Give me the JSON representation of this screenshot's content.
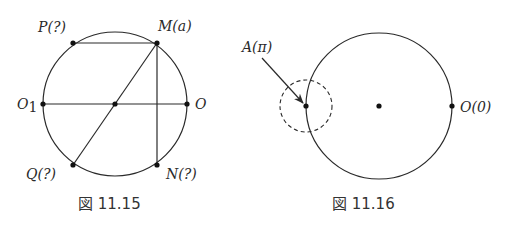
{
  "figures": [
    {
      "caption": "図 11.15",
      "points": {
        "P": {
          "label": "P(?)"
        },
        "M": {
          "label": "M(a)"
        },
        "O1": {
          "label": "O",
          "subscript": "1"
        },
        "O": {
          "label": "O"
        },
        "Q": {
          "label": "Q(?)"
        },
        "N": {
          "label": "N(?)"
        }
      },
      "segments": [
        "P-M",
        "M-Q",
        "M-N",
        "O1-O"
      ]
    },
    {
      "caption": "図 11.16",
      "points": {
        "A": {
          "label": "A(π)"
        },
        "O": {
          "label": "O(0)"
        }
      },
      "dashed_circle_around": "A",
      "arrow_to": "A"
    }
  ],
  "colors": {
    "ink": "#2a2a2a",
    "background": "#ffffff"
  }
}
